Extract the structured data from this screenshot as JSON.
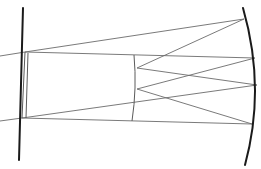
{
  "diagram": {
    "type": "optical-ray-diagram",
    "width": 261,
    "height": 169,
    "colors": {
      "background": "#ffffff",
      "ray": "#6b6b6b",
      "element": "#1a1a1a",
      "thin_element": "#5a5a5a"
    },
    "elements": {
      "left_plane": {
        "x1": 23,
        "y1": 8,
        "x2": 19,
        "y2": 160
      },
      "left_slit_inner": {
        "x1": 25,
        "y1": 52,
        "x2": 22,
        "y2": 118
      },
      "left_slit_outer": {
        "x1": 28,
        "y1": 53,
        "x2": 26,
        "y2": 118
      },
      "middle_element": {
        "d": "M134,55 Q137,88 132,121"
      },
      "mirror_arc": {
        "d": "M243,8 Q266,88 245,165"
      }
    },
    "hub_points": {
      "top": {
        "x": 25,
        "y": 52
      },
      "bottom": {
        "x": 22,
        "y": 118
      },
      "mid_upper": {
        "x": 137,
        "y": 68
      },
      "mid_lower": {
        "x": 137,
        "y": 89
      }
    },
    "rays": [
      {
        "x1": 0,
        "y1": 56,
        "x2": 25,
        "y2": 52
      },
      {
        "x1": 25,
        "y1": 52,
        "x2": 244,
        "y2": 19
      },
      {
        "x1": 25,
        "y1": 52,
        "x2": 255,
        "y2": 58
      },
      {
        "x1": 0,
        "y1": 121,
        "x2": 22,
        "y2": 118
      },
      {
        "x1": 22,
        "y1": 118,
        "x2": 257,
        "y2": 85
      },
      {
        "x1": 22,
        "y1": 118,
        "x2": 252,
        "y2": 124
      },
      {
        "x1": 244,
        "y1": 19,
        "x2": 137,
        "y2": 68
      },
      {
        "x1": 137,
        "y1": 68,
        "x2": 257,
        "y2": 85
      },
      {
        "x1": 255,
        "y1": 58,
        "x2": 137,
        "y2": 89
      },
      {
        "x1": 137,
        "y1": 89,
        "x2": 252,
        "y2": 124
      }
    ]
  }
}
